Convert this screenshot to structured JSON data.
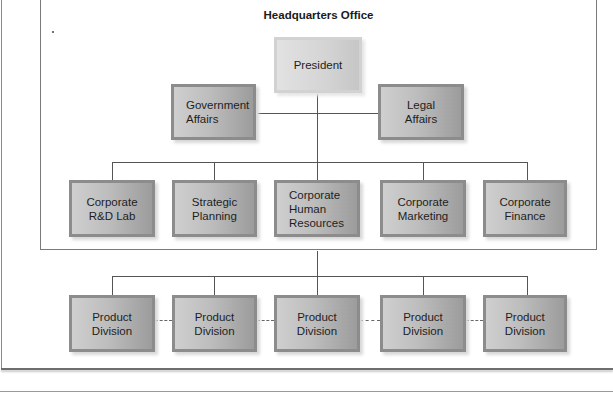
{
  "diagram": {
    "title": "Headquarters Office",
    "president": "President",
    "staff": [
      {
        "label": "Government\nAffairs"
      },
      {
        "label": "Legal\nAffairs"
      }
    ],
    "departments": [
      {
        "label": "Corporate\nR&D Lab"
      },
      {
        "label": "Strategic\nPlanning"
      },
      {
        "label": "Corporate\nHuman\nResources"
      },
      {
        "label": "Corporate\nMarketing"
      },
      {
        "label": "Corporate\nFinance"
      }
    ],
    "divisions": [
      {
        "label": "Product\nDivision"
      },
      {
        "label": "Product\nDivision"
      },
      {
        "label": "Product\nDivision"
      },
      {
        "label": "Product\nDivision"
      },
      {
        "label": "Product\nDivision"
      }
    ]
  }
}
